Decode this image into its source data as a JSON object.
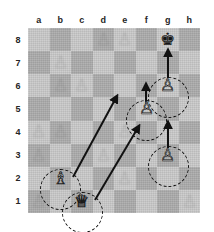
{
  "board": {
    "files": [
      "a",
      "b",
      "c",
      "d",
      "e",
      "f",
      "g",
      "h"
    ],
    "ranks": [
      "8",
      "7",
      "6",
      "5",
      "4",
      "3",
      "2",
      "1"
    ],
    "light_color": "#c9c9c9",
    "dark_color": "#ababab",
    "origin_x": 28,
    "origin_y": 28,
    "square_size": 21.5,
    "square_height": 23.1
  },
  "pieces": [
    {
      "id": "black-king-g8",
      "square": "g8",
      "file": 6,
      "rank": 0,
      "type": "king",
      "color": "black",
      "glyph": "♚",
      "prominent": true
    },
    {
      "id": "white-pawn-g6",
      "square": "g6",
      "file": 6,
      "rank": 2,
      "type": "pawn",
      "color": "white",
      "glyph": "♙",
      "prominent": true
    },
    {
      "id": "white-pawn-f5",
      "square": "f5",
      "file": 5,
      "rank": 3,
      "type": "pawn",
      "color": "white",
      "glyph": "♙",
      "prominent": true
    },
    {
      "id": "white-pawn-g3",
      "square": "g3",
      "file": 6,
      "rank": 5,
      "type": "pawn",
      "color": "white",
      "glyph": "♙",
      "prominent": true
    },
    {
      "id": "white-bishop-b2",
      "square": "b2",
      "file": 1,
      "rank": 6,
      "type": "bishop",
      "color": "white",
      "glyph": "♗",
      "prominent": true
    },
    {
      "id": "white-queen-c1",
      "square": "c1",
      "file": 2,
      "rank": 7,
      "type": "queen",
      "color": "white",
      "glyph": "♕",
      "prominent": true
    },
    {
      "id": "ghost-pawn-b7",
      "square": "b7",
      "file": 1,
      "rank": 1,
      "type": "pawn",
      "color": "faded",
      "glyph": "♙",
      "prominent": false
    },
    {
      "id": "ghost-pawn-c6",
      "square": "c6",
      "file": 2,
      "rank": 2,
      "type": "pawn",
      "color": "faded",
      "glyph": "♙",
      "prominent": false
    },
    {
      "id": "ghost-pawn-b6",
      "square": "b6",
      "file": 1,
      "rank": 2,
      "type": "pawn",
      "color": "faded",
      "glyph": "♙",
      "prominent": false
    },
    {
      "id": "ghost-pawn-a4",
      "square": "a4",
      "file": 0,
      "rank": 4,
      "type": "pawn",
      "color": "faded",
      "glyph": "♙",
      "prominent": false
    },
    {
      "id": "ghost-pawn-b4",
      "square": "b4",
      "file": 1,
      "rank": 4,
      "type": "pawn",
      "color": "faded",
      "glyph": "♙",
      "prominent": false
    },
    {
      "id": "ghost-pawn-e4",
      "square": "e4",
      "file": 4,
      "rank": 4,
      "type": "pawn",
      "color": "faded",
      "glyph": "♙",
      "prominent": false
    },
    {
      "id": "ghost-pawn-a3",
      "square": "a3",
      "file": 0,
      "rank": 5,
      "type": "pawn",
      "color": "faded",
      "glyph": "♙",
      "prominent": false
    },
    {
      "id": "ghost-pawn-d3",
      "square": "d3",
      "file": 3,
      "rank": 5,
      "type": "pawn",
      "color": "faded",
      "glyph": "♙",
      "prominent": false
    },
    {
      "id": "ghost-pawn-e2",
      "square": "e2",
      "file": 4,
      "rank": 6,
      "type": "pawn",
      "color": "faded",
      "glyph": "♙",
      "prominent": false
    },
    {
      "id": "ghost-pawn-a1",
      "square": "a1",
      "file": 0,
      "rank": 7,
      "type": "pawn",
      "color": "faded",
      "glyph": "♙",
      "prominent": false
    },
    {
      "id": "ghost-pawn-h1",
      "square": "h1",
      "file": 7,
      "rank": 7,
      "type": "pawn",
      "color": "faded",
      "glyph": "♙",
      "prominent": false
    },
    {
      "id": "ghost-pawn-d8",
      "square": "d8",
      "file": 3,
      "rank": 0,
      "type": "pawn",
      "color": "faded",
      "glyph": "♙",
      "prominent": false
    },
    {
      "id": "ghost-pawn-e8",
      "square": "e8",
      "file": 4,
      "rank": 0,
      "type": "pawn",
      "color": "faded",
      "glyph": "♙",
      "prominent": false
    }
  ],
  "highlights": [
    {
      "id": "highlight-g6",
      "square": "g6",
      "cx": 168.0,
      "cy": 97.5,
      "r": 20.5
    },
    {
      "id": "highlight-f5",
      "square": "f5",
      "cx": 146.5,
      "cy": 120.5,
      "r": 20.5
    },
    {
      "id": "highlight-g3",
      "square": "g3",
      "cx": 168.0,
      "cy": 166.5,
      "r": 20.5
    },
    {
      "id": "highlight-b2",
      "square": "b2",
      "cx": 60.5,
      "cy": 189.5,
      "r": 20.5
    },
    {
      "id": "highlight-c1",
      "square": "c1",
      "cx": 82.0,
      "cy": 212.5,
      "r": 20.5
    }
  ],
  "arrows": [
    {
      "id": "arrow-g6-to-g8",
      "from": "g6",
      "to": "g8",
      "x1": 168,
      "y1": 78,
      "x2": 168,
      "y2": 50,
      "kind": "straight"
    },
    {
      "id": "arrow-f5-to-f6",
      "from": "f5",
      "to": "f6",
      "x1": 146,
      "y1": 104,
      "x2": 146,
      "y2": 84,
      "kind": "straight"
    },
    {
      "id": "arrow-g3-to-g5",
      "from": "g3",
      "to": "g5",
      "x1": 168,
      "y1": 148,
      "x2": 168,
      "y2": 122,
      "kind": "straight"
    },
    {
      "id": "arrow-b2-to-e4",
      "from": "b2",
      "to": "e4",
      "x1": 73,
      "y1": 177,
      "x2": 117,
      "y2": 96,
      "kind": "diagonal"
    },
    {
      "id": "arrow-c1-to-f3",
      "from": "c1",
      "to": "f3",
      "x1": 95,
      "y1": 200,
      "x2": 139,
      "y2": 126,
      "kind": "diagonal"
    }
  ],
  "annotations": {
    "arrow_color": "#111111",
    "highlight_style": "dashed-circle"
  }
}
